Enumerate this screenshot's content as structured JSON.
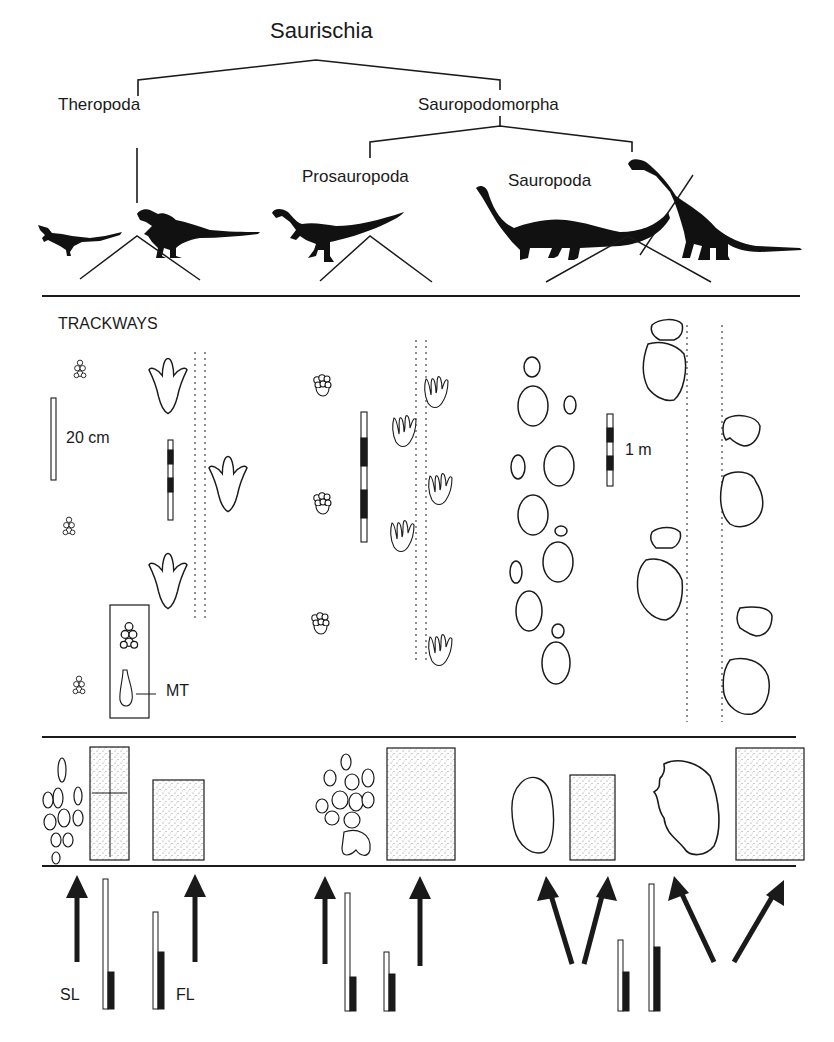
{
  "figure": {
    "colors": {
      "ink": "#1a1a1a",
      "background": "#ffffff",
      "stipple": "#8a8a8a"
    },
    "cladogram": {
      "root": "Saurischia",
      "branches": [
        {
          "label": "Theropoda"
        },
        {
          "label": "Sauropodomorpha",
          "children": [
            {
              "label": "Prosauropoda"
            },
            {
              "label": "Sauropoda"
            }
          ]
        }
      ]
    },
    "trackways": {
      "heading": "TRACKWAYS",
      "scale_small": "20 cm",
      "scale_large": "1 m",
      "metatarsal_label": "MT"
    },
    "footprint_shapes": {
      "rows": [
        "theropod-pes",
        "prosauropod-pes",
        "sauropod-manus",
        "sauropod-pes"
      ]
    },
    "gait_legend": {
      "stride_length_label": "SL",
      "foot_length_label": "FL"
    }
  }
}
